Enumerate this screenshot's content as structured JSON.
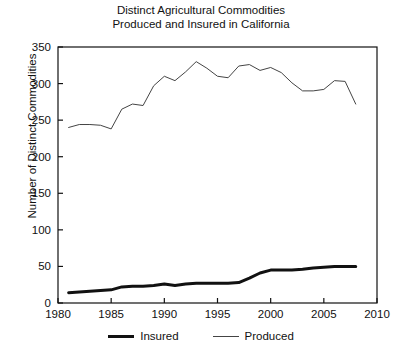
{
  "chart_data": {
    "type": "line",
    "title": "Distinct Agricultural Commodities\nProduced and Insured in California",
    "title_line1": "Distinct Agricultural Commodities",
    "title_line2": "Produced and Insured in California",
    "xlabel": "",
    "ylabel": "Number of Distinct Commodities",
    "xlim": [
      1980,
      2010
    ],
    "ylim": [
      0,
      350
    ],
    "xticks": [
      1980,
      1985,
      1990,
      1995,
      2000,
      2005,
      2010
    ],
    "yticks": [
      0,
      50,
      100,
      150,
      200,
      250,
      300,
      350
    ],
    "grid": false,
    "legend_position": "below",
    "x": [
      1981,
      1982,
      1983,
      1984,
      1985,
      1986,
      1987,
      1988,
      1989,
      1990,
      1991,
      1992,
      1993,
      1994,
      1995,
      1996,
      1997,
      1998,
      1999,
      2000,
      2001,
      2002,
      2003,
      2004,
      2005,
      2006,
      2007,
      2008
    ],
    "series": [
      {
        "name": "Insured",
        "style": "thick",
        "color": "#111111",
        "values": [
          14,
          15,
          16,
          17,
          18,
          22,
          23,
          23,
          24,
          26,
          24,
          26,
          27,
          27,
          27,
          27,
          28,
          34,
          41,
          45,
          45,
          45,
          46,
          48,
          49,
          50,
          50,
          50
        ]
      },
      {
        "name": "Produced",
        "style": "thin",
        "color": "#444444",
        "values": [
          240,
          244,
          244,
          243,
          238,
          265,
          272,
          270,
          297,
          310,
          304,
          316,
          330,
          321,
          310,
          308,
          324,
          326,
          318,
          322,
          315,
          301,
          290,
          290,
          292,
          304,
          303,
          272
        ]
      }
    ]
  },
  "legend": {
    "items": [
      {
        "label": "Insured"
      },
      {
        "label": "Produced"
      }
    ]
  }
}
